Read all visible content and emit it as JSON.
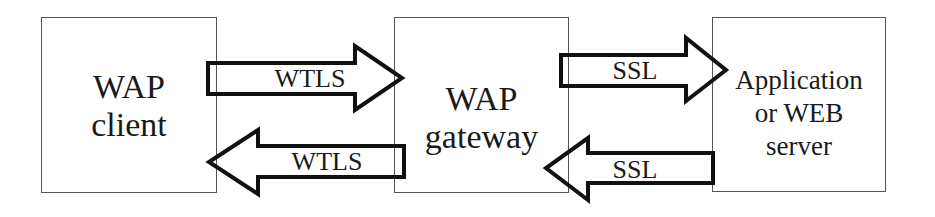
{
  "diagram": {
    "nodes": [
      {
        "id": "wap-client",
        "lines": [
          "WAP",
          "client"
        ]
      },
      {
        "id": "wap-gateway",
        "lines": [
          "WAP",
          "gateway"
        ]
      },
      {
        "id": "app-server",
        "lines": [
          "Application",
          "or WEB",
          "server"
        ]
      }
    ],
    "edges": [
      {
        "from": "wap-client",
        "to": "wap-gateway",
        "label": "WTLS",
        "direction": "right"
      },
      {
        "from": "wap-gateway",
        "to": "wap-client",
        "label": "WTLS",
        "direction": "left"
      },
      {
        "from": "wap-gateway",
        "to": "app-server",
        "label": "SSL",
        "direction": "right"
      },
      {
        "from": "app-server",
        "to": "wap-gateway",
        "label": "SSL",
        "direction": "left"
      }
    ],
    "colors": {
      "stroke": "#1a1a1a",
      "box_border": "#555555",
      "background": "#ffffff"
    }
  }
}
